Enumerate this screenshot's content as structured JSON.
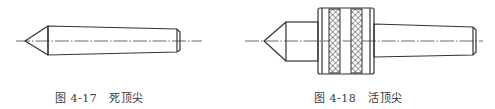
{
  "figures": [
    {
      "id": "4-17",
      "number_label": "图 4-17",
      "title": "死顶尖",
      "description": "dead center: conical point with tapered shank"
    },
    {
      "id": "4-18",
      "number_label": "图 4-18",
      "title": "活顶尖",
      "description": "live center: conical point, knurled bearing housing, tapered shank"
    }
  ],
  "colors": {
    "line": "#333333",
    "background": "#ffffff",
    "caption": "#3a3a3a"
  }
}
